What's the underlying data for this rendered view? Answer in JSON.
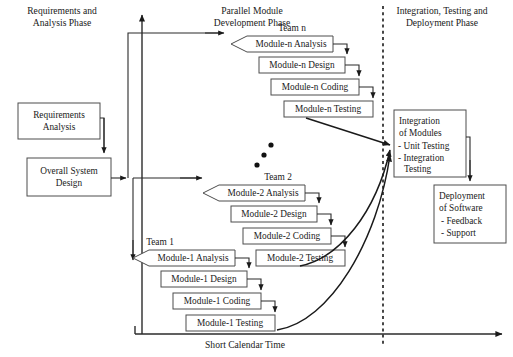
{
  "diagram": {
    "axis_label": "Short Calendar Time",
    "phases": [
      {
        "id": "phase-requirements",
        "label_line1": "Requirements and",
        "label_line2": "Analysis Phase"
      },
      {
        "id": "phase-parallel",
        "label_line1": "Parallel Module",
        "label_line2": "Development Phase"
      },
      {
        "id": "phase-integration",
        "label_line1": "Integration, Testing and",
        "label_line2": "Deployment Phase"
      }
    ],
    "left_boxes": [
      {
        "id": "requirements-analysis",
        "line1": "Requirements",
        "line2": "Analysis"
      },
      {
        "id": "overall-system-design",
        "line1": "Overall System",
        "line2": "Design"
      }
    ],
    "teams": [
      {
        "id": "team-n",
        "label": "Team n",
        "steps": [
          {
            "id": "module-n-analysis",
            "label": "Module-n Analysis"
          },
          {
            "id": "module-n-design",
            "label": "Module-n Design"
          },
          {
            "id": "module-n-coding",
            "label": "Module-n Coding"
          },
          {
            "id": "module-n-testing",
            "label": "Module-n Testing"
          }
        ]
      },
      {
        "id": "team-2",
        "label": "Team 2",
        "steps": [
          {
            "id": "module-2-analysis",
            "label": "Module-2 Analysis"
          },
          {
            "id": "module-2-design",
            "label": "Module-2 Design"
          },
          {
            "id": "module-2-coding",
            "label": "Module-2 Coding"
          },
          {
            "id": "module-2-testing",
            "label": "Module-2 Testing"
          }
        ]
      },
      {
        "id": "team-1",
        "label": "Team 1",
        "steps": [
          {
            "id": "module-1-analysis",
            "label": "Module-1 Analysis"
          },
          {
            "id": "module-1-design",
            "label": "Module-1 Design"
          },
          {
            "id": "module-1-coding",
            "label": "Module-1 Coding"
          },
          {
            "id": "module-1-testing",
            "label": "Module-1 Testing"
          }
        ]
      }
    ],
    "right_boxes": [
      {
        "id": "integration-of-modules",
        "line1": "Integration",
        "line2": "of Modules",
        "bullet1": "- Unit Testing",
        "bullet2": "- Integration",
        "bullet3": "Testing"
      },
      {
        "id": "deployment-of-software",
        "line1": "Deployment",
        "line2": "of Software",
        "bullet1": "- Feedback",
        "bullet2": "- Support"
      }
    ],
    "colors": {
      "background": "#ffffff",
      "box_stroke": "#4c4c4c",
      "line": "#2b2b2b",
      "text": "#1a1a1a",
      "divider": "#1a1a1a"
    }
  }
}
